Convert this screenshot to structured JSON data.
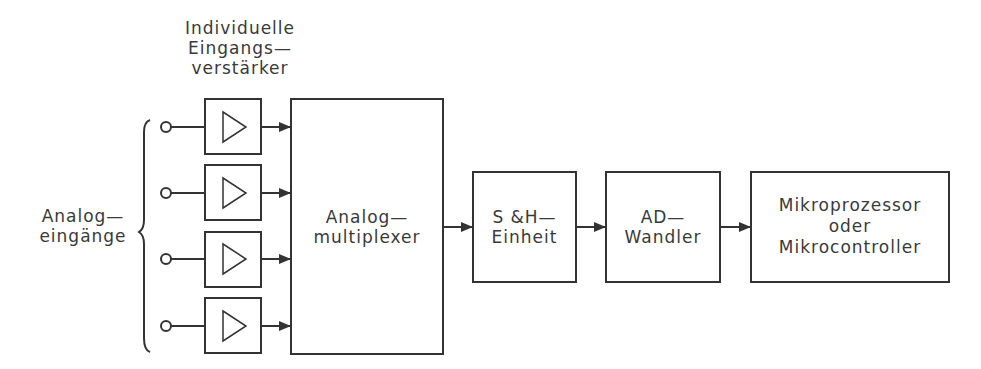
{
  "diagram": {
    "title_label": [
      "Individuelle",
      "Eingangs—",
      "verstärker"
    ],
    "inputs_label": [
      "Analog—",
      "eingänge"
    ],
    "input_count": 4,
    "blocks": [
      {
        "id": "mux",
        "lines": [
          "Analog—",
          "multiplexer"
        ]
      },
      {
        "id": "sh",
        "lines": [
          "S &H—",
          "Einheit"
        ]
      },
      {
        "id": "adc",
        "lines": [
          "AD—",
          "Wandler"
        ]
      },
      {
        "id": "mcu",
        "lines": [
          "Mikroprozessor",
          "oder",
          "Mikrocontroller"
        ]
      }
    ],
    "line_color": "#333333"
  }
}
